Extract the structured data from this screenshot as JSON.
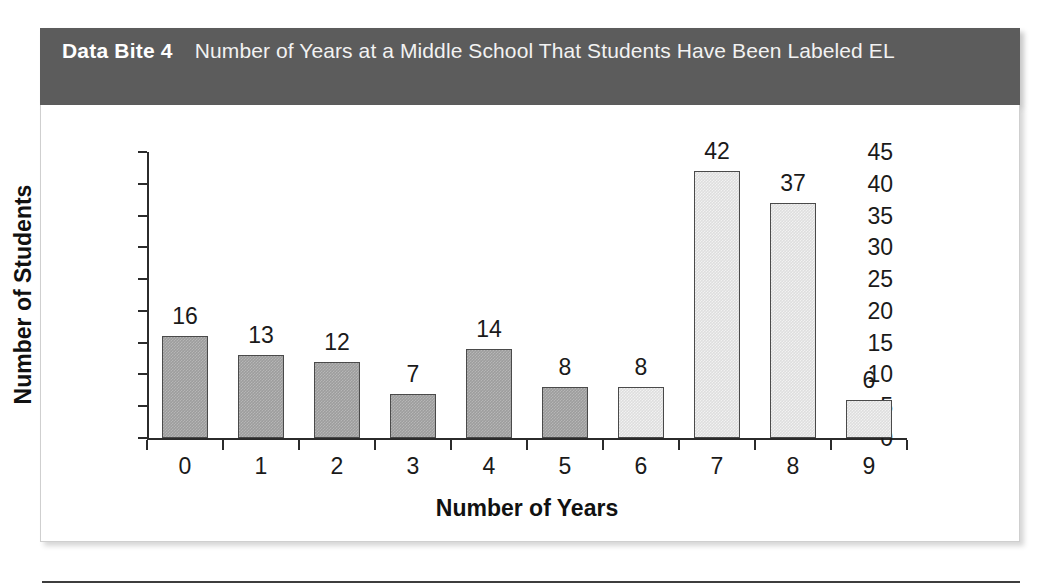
{
  "header": {
    "label": "Data Bite 4",
    "title": "Number of Years at a Middle School That Students Have Been Labeled EL",
    "band_color": "#5c5c5c",
    "text_color": "#ffffff"
  },
  "chart_data": {
    "type": "bar",
    "title": "Number of Years at a Middle School That Students Have Been Labeled EL",
    "categories": [
      "0",
      "1",
      "2",
      "3",
      "4",
      "5",
      "6",
      "7",
      "8",
      "9"
    ],
    "values": [
      16,
      13,
      12,
      7,
      14,
      8,
      8,
      42,
      37,
      6
    ],
    "bar_colors": [
      "dark",
      "dark",
      "dark",
      "dark",
      "dark",
      "dark",
      "light",
      "light",
      "light",
      "light"
    ],
    "xlabel": "Number of Years",
    "ylabel": "Number of Students",
    "ylim": [
      0,
      45
    ],
    "ytick_values": [
      0,
      5,
      10,
      15,
      20,
      25,
      30,
      35,
      40,
      45
    ],
    "ytick_labels": [
      "0",
      "5",
      "10",
      "15",
      "20",
      "25",
      "30",
      "35",
      "40",
      "45"
    ],
    "grid": false,
    "legend": null,
    "data_labels": true,
    "palette": {
      "dark_bar": "#9d9d9d",
      "light_bar": "#dedede",
      "bar_outline": "#4a4a4a",
      "axis": "#2b2b2b",
      "text": "#1a1a1a"
    }
  }
}
